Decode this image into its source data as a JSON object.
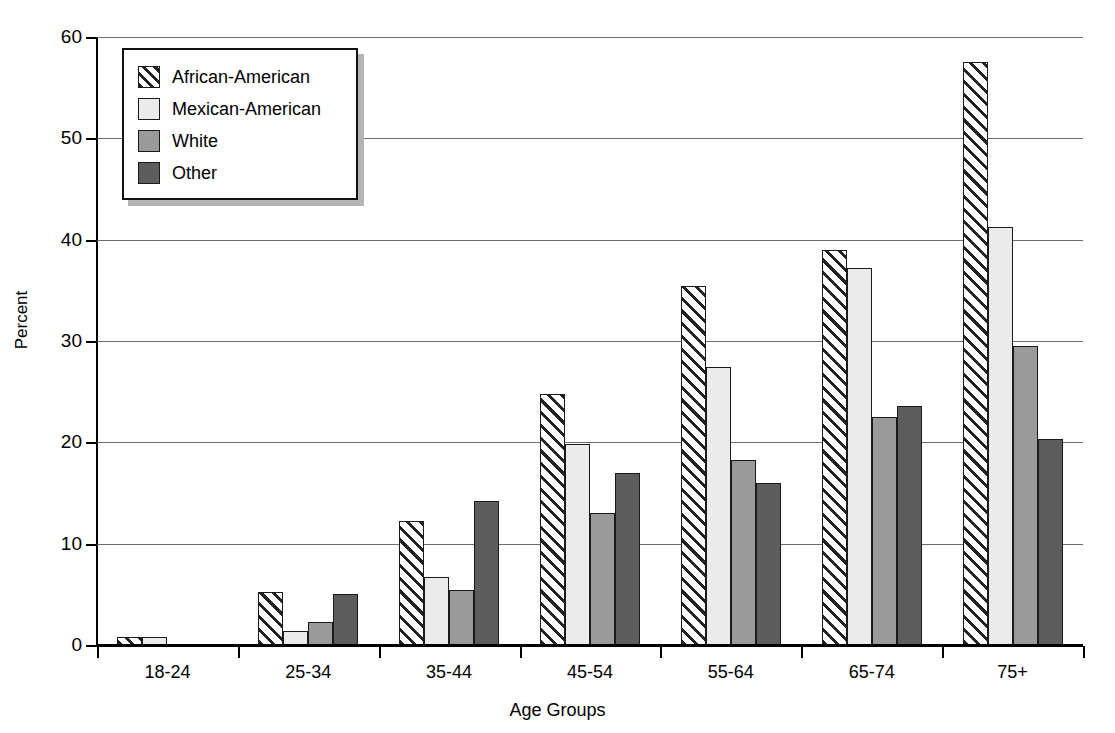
{
  "chart_data": {
    "type": "bar",
    "title": "",
    "xlabel": "Age Groups",
    "ylabel": "Percent",
    "categories": [
      "18-24",
      "25-34",
      "35-44",
      "45-54",
      "55-64",
      "65-74",
      "75+"
    ],
    "ylim": [
      0,
      60
    ],
    "yticks": [
      0,
      10,
      20,
      30,
      40,
      50,
      60
    ],
    "grid": true,
    "legend_position": "top-left",
    "series": [
      {
        "name": "African-American",
        "color": "#ffffff",
        "pattern": "diagonal-hatch",
        "values": [
          0.8,
          5.2,
          12.2,
          24.8,
          35.4,
          39.0,
          57.5
        ]
      },
      {
        "name": "Mexican-American",
        "color": "#ebebeb",
        "pattern": "solid",
        "values": [
          0.8,
          1.4,
          6.7,
          19.8,
          27.4,
          37.2,
          41.3
        ]
      },
      {
        "name": "White",
        "color": "#9a9a9a",
        "pattern": "solid",
        "values": [
          0,
          2.3,
          5.4,
          13.0,
          18.3,
          22.5,
          29.5
        ]
      },
      {
        "name": "Other",
        "color": "#5d5d5d",
        "pattern": "solid",
        "values": [
          0,
          5.0,
          14.2,
          17.0,
          16.0,
          23.6,
          20.3
        ]
      }
    ]
  }
}
